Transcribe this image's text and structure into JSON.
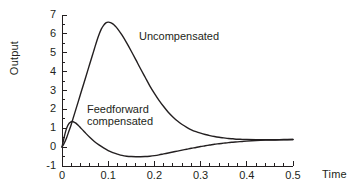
{
  "chart_data": {
    "type": "line",
    "title": "",
    "subtitle": "",
    "xlabel": "Time",
    "ylabel": "Output",
    "xlim": [
      0,
      0.5
    ],
    "ylim": [
      -1,
      7
    ],
    "grid": false,
    "legend_position": "inline-annotations",
    "x_ticks": [
      "0",
      "0.1",
      "0.2",
      "0.3",
      "0.4",
      "0.5"
    ],
    "x_tick_values": [
      0,
      0.1,
      0.2,
      0.3,
      0.4,
      0.5
    ],
    "x_minor_step": 0.02,
    "y_ticks": [
      "-1",
      "0",
      "1",
      "2",
      "3",
      "4",
      "5",
      "6",
      "7"
    ],
    "y_tick_values": [
      -1,
      0,
      1,
      2,
      3,
      4,
      5,
      6,
      7
    ],
    "y_minor_step": 0.5,
    "line_color": "#231f20",
    "background_color": "#ffffff",
    "series": [
      {
        "name": "Uncompensated",
        "label": "Uncompensated",
        "x": [
          0,
          0.005,
          0.01,
          0.015,
          0.02,
          0.025,
          0.03,
          0.035,
          0.04,
          0.045,
          0.05,
          0.055,
          0.06,
          0.065,
          0.07,
          0.075,
          0.08,
          0.085,
          0.09,
          0.095,
          0.1,
          0.105,
          0.11,
          0.115,
          0.12,
          0.13,
          0.14,
          0.15,
          0.16,
          0.17,
          0.18,
          0.19,
          0.2,
          0.21,
          0.22,
          0.23,
          0.24,
          0.25,
          0.26,
          0.27,
          0.28,
          0.29,
          0.3,
          0.31,
          0.32,
          0.33,
          0.34,
          0.35,
          0.36,
          0.37,
          0.38,
          0.39,
          0.4,
          0.42,
          0.44,
          0.46,
          0.48,
          0.5
        ],
        "y": [
          0.0,
          0.22,
          0.5,
          0.85,
          1.2,
          1.6,
          2.0,
          2.4,
          2.8,
          3.2,
          3.6,
          4.0,
          4.4,
          4.8,
          5.2,
          5.6,
          5.95,
          6.25,
          6.45,
          6.58,
          6.62,
          6.6,
          6.53,
          6.42,
          6.28,
          5.93,
          5.52,
          5.08,
          4.62,
          4.15,
          3.7,
          3.25,
          2.85,
          2.48,
          2.15,
          1.85,
          1.6,
          1.38,
          1.2,
          1.05,
          0.92,
          0.82,
          0.74,
          0.67,
          0.61,
          0.56,
          0.52,
          0.49,
          0.46,
          0.44,
          0.42,
          0.41,
          0.4,
          0.39,
          0.39,
          0.39,
          0.4,
          0.4
        ]
      },
      {
        "name": "Feedforward compensated",
        "label": "Feedforward\ncompensated",
        "x": [
          0,
          0.004,
          0.008,
          0.012,
          0.016,
          0.02,
          0.022,
          0.026,
          0.03,
          0.035,
          0.04,
          0.045,
          0.05,
          0.06,
          0.07,
          0.08,
          0.09,
          0.1,
          0.11,
          0.12,
          0.13,
          0.14,
          0.15,
          0.16,
          0.17,
          0.18,
          0.19,
          0.2,
          0.21,
          0.22,
          0.23,
          0.24,
          0.25,
          0.26,
          0.27,
          0.28,
          0.29,
          0.3,
          0.31,
          0.32,
          0.33,
          0.34,
          0.35,
          0.36,
          0.37,
          0.38,
          0.39,
          0.4,
          0.42,
          0.44,
          0.46,
          0.48,
          0.5
        ],
        "y": [
          0.0,
          0.45,
          0.85,
          1.12,
          1.28,
          1.35,
          1.36,
          1.33,
          1.27,
          1.16,
          1.03,
          0.9,
          0.77,
          0.52,
          0.3,
          0.12,
          -0.04,
          -0.18,
          -0.29,
          -0.37,
          -0.44,
          -0.48,
          -0.5,
          -0.51,
          -0.51,
          -0.5,
          -0.48,
          -0.45,
          -0.41,
          -0.36,
          -0.31,
          -0.26,
          -0.21,
          -0.16,
          -0.11,
          -0.06,
          -0.02,
          0.03,
          0.07,
          0.11,
          0.15,
          0.18,
          0.21,
          0.24,
          0.26,
          0.28,
          0.3,
          0.32,
          0.35,
          0.37,
          0.38,
          0.39,
          0.4
        ]
      }
    ],
    "annotations": [
      {
        "text": "Uncompensated",
        "x": 0.175,
        "y": 5.35
      },
      {
        "text": "Feedforward compensated",
        "x": 0.055,
        "y": 1.55
      }
    ]
  }
}
